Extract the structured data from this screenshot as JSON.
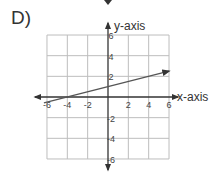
{
  "problem_label": "D)",
  "chart_data": {
    "type": "line",
    "title": "",
    "xlabel": "x-axis",
    "ylabel": "y-axis",
    "xlim": [
      -6,
      6
    ],
    "ylim": [
      -6,
      6
    ],
    "grid": true,
    "grid_step": 2,
    "x_ticks": [
      -6,
      -4,
      -2,
      2,
      4,
      6
    ],
    "y_ticks": [
      6,
      4,
      2,
      -2,
      -4,
      -6
    ],
    "x_tick_labels": [
      "-6",
      "-4",
      "-2",
      "2",
      "4",
      "6"
    ],
    "y_tick_labels": [
      "6",
      "4",
      "2",
      "-2",
      "-4",
      "-6"
    ],
    "series": [
      {
        "name": "line",
        "equation": "y = 0.25x + 1",
        "slope": 0.25,
        "intercept": 1,
        "x": [
          -6.3,
          6
        ],
        "y": [
          -0.575,
          2.5
        ],
        "arrow_end": "right"
      }
    ],
    "legend": null
  },
  "colors": {
    "grid": "#bdbdbd",
    "axis": "#333333",
    "line": "#555555"
  }
}
